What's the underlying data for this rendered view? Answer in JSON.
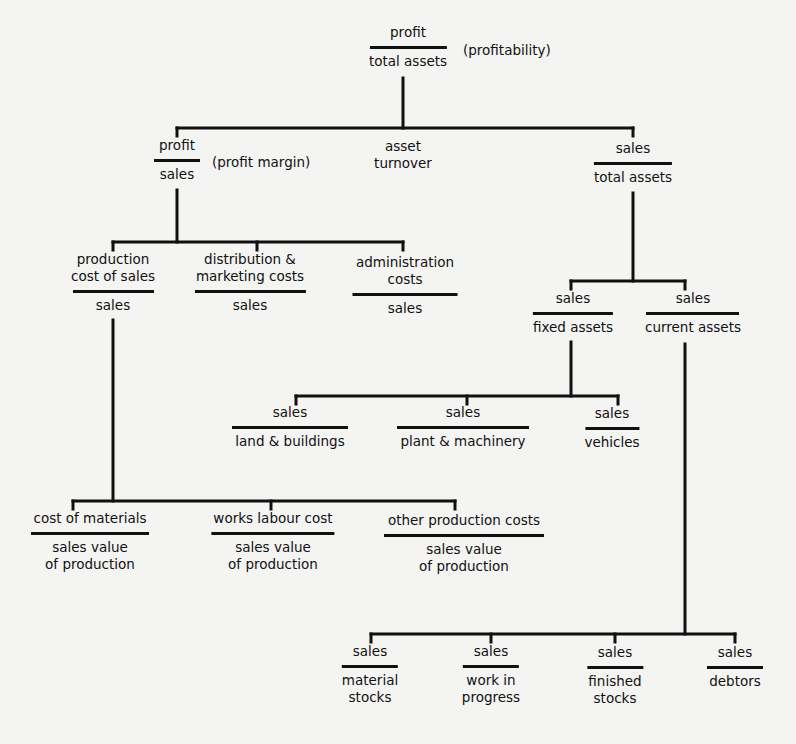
{
  "diagram": {
    "type": "ratio-pyramid",
    "root": {
      "numerator": "profit",
      "denominator": "total assets",
      "note": "(profitability)"
    },
    "level1": {
      "profit_margin": {
        "numerator": "profit",
        "denominator": "sales",
        "note": "(profit margin)"
      },
      "asset_turnover": {
        "label_line1": "asset",
        "label_line2": "turnover"
      },
      "sales_total_assets": {
        "numerator": "sales",
        "denominator": "total assets"
      }
    },
    "cost_ratios": [
      {
        "numerator_line1": "production",
        "numerator_line2": "cost of sales",
        "denominator": "sales"
      },
      {
        "numerator_line1": "distribution &",
        "numerator_line2": "marketing costs",
        "denominator": "sales"
      },
      {
        "numerator_line1": "administration",
        "numerator_line2": "costs",
        "denominator": "sales"
      }
    ],
    "asset_ratios": [
      {
        "numerator": "sales",
        "denominator": "fixed assets"
      },
      {
        "numerator": "sales",
        "denominator": "current assets"
      }
    ],
    "fixed_asset_ratios": [
      {
        "numerator": "sales",
        "denominator": "land & buildings"
      },
      {
        "numerator": "sales",
        "denominator": "plant & machinery"
      },
      {
        "numerator": "sales",
        "denominator": "vehicles"
      }
    ],
    "production_cost_ratios": [
      {
        "numerator": "cost of materials",
        "denominator_line1": "sales value",
        "denominator_line2": "of production"
      },
      {
        "numerator": "works labour cost",
        "denominator_line1": "sales value",
        "denominator_line2": "of production"
      },
      {
        "numerator": "other production costs",
        "denominator_line1": "sales value",
        "denominator_line2": "of production"
      }
    ],
    "current_asset_ratios": [
      {
        "numerator": "sales",
        "denominator_line1": "material",
        "denominator_line2": "stocks"
      },
      {
        "numerator": "sales",
        "denominator_line1": "work in",
        "denominator_line2": "progress"
      },
      {
        "numerator": "sales",
        "denominator_line1": "finished",
        "denominator_line2": "stocks"
      },
      {
        "numerator": "sales",
        "denominator_line1": "debtors",
        "denominator_line2": ""
      }
    ]
  },
  "colors": {
    "ink": "#111111",
    "paper": "#f4f4f2"
  }
}
